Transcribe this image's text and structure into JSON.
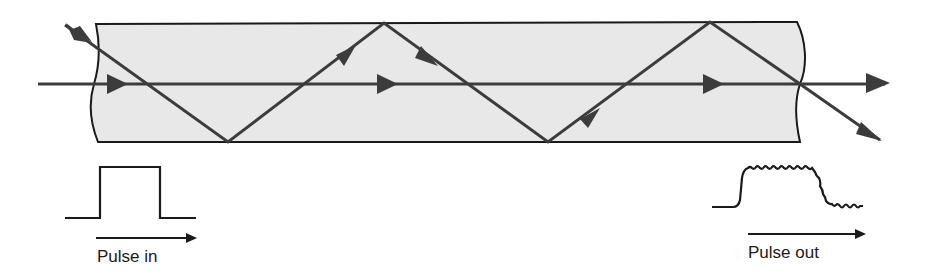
{
  "diagram": {
    "colors": {
      "fiber_fill": "#e8e8e8",
      "fiber_outline": "#1a1a1a",
      "ray": "#3c3c3c",
      "pulse": "#1a1a1a",
      "background": "#ffffff"
    },
    "rays": [
      {
        "name": "axial-ray",
        "description": "straight ray along fiber axis"
      },
      {
        "name": "zigzag-ray",
        "description": "ray reflecting between core boundaries"
      }
    ],
    "pulse_in": {
      "label": "Pulse in",
      "shape": "square"
    },
    "pulse_out": {
      "label": "Pulse out",
      "shape": "broadened, rippled"
    }
  }
}
